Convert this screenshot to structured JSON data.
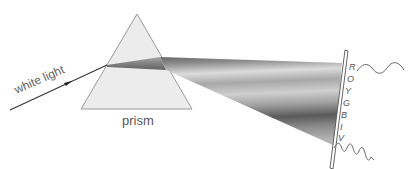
{
  "diagram": {
    "labels": {
      "incident_light": "white light",
      "prism": "prism"
    },
    "spectrum_letters": [
      "R",
      "O",
      "Y",
      "G",
      "B",
      "I",
      "V"
    ],
    "spectrum_meaning": [
      "red",
      "orange",
      "yellow",
      "green",
      "blue",
      "indigo",
      "violet"
    ],
    "waves": {
      "top": "long-wavelength wave (red)",
      "bottom": "short-wavelength wave (violet)"
    },
    "colors": {
      "prism_fill": "#ebebeb",
      "prism_edge": "#9a9a9a",
      "beam_dark": "#555555",
      "beam_light": "#d8d8d8",
      "line": "#333333",
      "text": "#555555"
    }
  }
}
